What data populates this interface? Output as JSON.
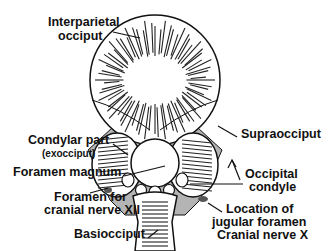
{
  "diagram": {
    "colors": {
      "outline": "#111111",
      "cartilage_fill": "#b4b4b4",
      "background": "#ffffff"
    },
    "labels": {
      "interparietal_line1": "Interparietal",
      "interparietal_line2": "occiput",
      "supraocciput": "Supraocciput",
      "condylar_line1": "Condylar part",
      "condylar_line2": "(exocciput)",
      "foramen_magnum": "Foramen magnum",
      "occipital_condyle_line1": "Occipital",
      "occipital_condyle_line2": "condyle",
      "hypoglossal_line1": "Foramen for",
      "hypoglossal_line2": "cranial nerve XII",
      "jugular_line1": "Location of",
      "jugular_line2": "jugular foramen",
      "jugular_line3": "Cranial nerve X",
      "basiocciput": "Basiocciput"
    }
  }
}
